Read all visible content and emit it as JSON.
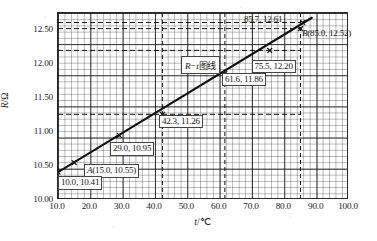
{
  "chart_data": {
    "type": "line",
    "title": "",
    "xlabel": "t/℃",
    "ylabel": "R/Ω",
    "xlim": [
      10.0,
      100.0
    ],
    "ylim": [
      10.0,
      12.75
    ],
    "xticks": [
      "10.0",
      "20.0",
      "30.0",
      "40.0",
      "50.0",
      "60.0",
      "70.0",
      "80.0",
      "90.0",
      "100.0"
    ],
    "xtick_values": [
      10,
      20,
      30,
      40,
      50,
      60,
      70,
      80,
      90,
      100
    ],
    "yticks": [
      "10.00",
      "10.50",
      "11.00",
      "11.50",
      "12.00",
      "12.50"
    ],
    "ytick_values": [
      10.0,
      10.5,
      11.0,
      11.5,
      12.0,
      12.5
    ],
    "grid": "graph-paper minor 2 units / major 10 units",
    "legend_position": "inline-annotation",
    "series": [
      {
        "name": "R−t图线",
        "x": [
          10.0,
          15.0,
          29.0,
          42.3,
          61.6,
          75.5,
          85.0,
          85.7
        ],
        "y": [
          10.41,
          10.55,
          10.95,
          11.26,
          11.86,
          12.2,
          12.52,
          12.61
        ],
        "line_endpoints": {
          "x": [
            10.0,
            88.5
          ],
          "y": [
            10.41,
            12.68
          ]
        }
      }
    ],
    "points": [
      {
        "id": "p-10-0",
        "label": "10.0, 10.41",
        "x": 10.0,
        "y": 10.41,
        "marker": true
      },
      {
        "id": "p-a",
        "label": "A(15.0, 10.55)",
        "x": 15.0,
        "y": 10.55,
        "marker": true
      },
      {
        "id": "p-29-0",
        "label": "29.0, 10.95",
        "x": 29.0,
        "y": 10.95,
        "marker": true
      },
      {
        "id": "p-42-3",
        "label": "42.3, 11.26",
        "x": 42.3,
        "y": 11.26,
        "marker": true
      },
      {
        "id": "p-61-6",
        "label": "61.6, 11.86",
        "x": 61.6,
        "y": 11.86,
        "marker": true
      },
      {
        "id": "p-75-5",
        "label": "75.5, 12.20",
        "x": 75.5,
        "y": 12.2,
        "marker": true
      },
      {
        "id": "p-b",
        "label": "B(85.0, 12.52)",
        "x": 85.0,
        "y": 12.52,
        "marker": true
      },
      {
        "id": "p-85-7",
        "label": "85.7, 12.61",
        "x": 85.7,
        "y": 12.61,
        "marker": true
      }
    ],
    "guide_lines": {
      "horizontal_values": [
        11.26,
        12.2,
        12.52,
        12.61
      ],
      "vertical_values": [
        42.3,
        61.6,
        85.0
      ],
      "style": "dashed"
    },
    "annotations": [
      {
        "text": "85.7, 12.61"
      },
      {
        "text": "B(85.0, 12.52)"
      },
      {
        "text": "75.5, 12.20"
      },
      {
        "text": "61.6, 11.86"
      },
      {
        "text": "R−t图线"
      },
      {
        "text": "42.3, 11.26"
      },
      {
        "text": "29.0, 10.95"
      },
      {
        "text": "A(15.0, 10.55)"
      },
      {
        "text": "10.0, 10.41"
      }
    ],
    "colors": {
      "series_line": "#101010",
      "grid_minor": "#7a7a7a",
      "grid_major": "#2a2a2a",
      "axis": "#2a2a2a",
      "background": "#ffffff"
    }
  },
  "labels": {
    "y_axis": "R/Ω",
    "y_axis_symbol": "R",
    "y_axis_unit": "/Ω",
    "x_axis": "t/℃",
    "x_axis_symbol": "t",
    "x_axis_unit": "/℃",
    "curve": "R−t图线",
    "curve_symbol": "R−t",
    "curve_word": "图线"
  },
  "callouts": {
    "c1": "85.7, 12.61",
    "c2": "B(85.0, 12.52)",
    "c2_point": "B",
    "c2_rest": "(85.0, 12.52)",
    "c3": "75.5, 12.20",
    "c4": "61.6, 11.86",
    "c5": "42.3, 11.26",
    "c6": "29.0, 10.95",
    "c7_point": "A",
    "c7_rest": "(15.0, 10.55)",
    "c8": "10.0, 10.41"
  },
  "ticks": {
    "y": [
      "12.50",
      "12.00",
      "11.50",
      "11.00",
      "10.50",
      "10.00"
    ],
    "x": [
      "10.0",
      "20.0",
      "30.0",
      "40.0",
      "50.0",
      "60.0",
      "70.0",
      "80.0",
      "90.0",
      "100.0"
    ]
  }
}
